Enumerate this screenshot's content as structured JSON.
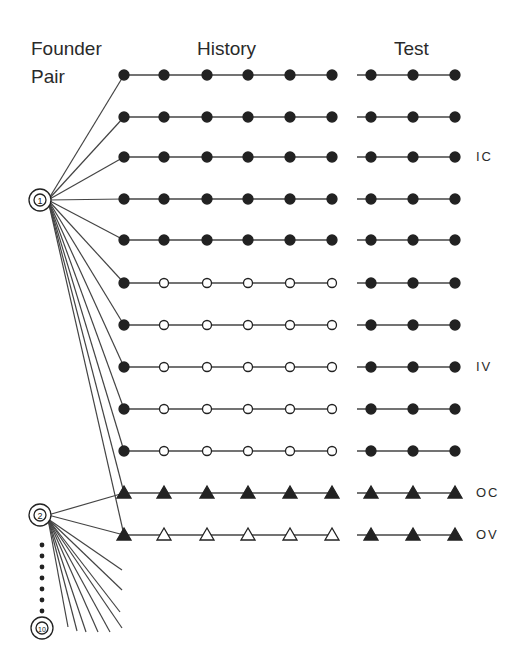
{
  "headers": {
    "founder_line1": "Founder",
    "founder_line2": "Pair",
    "history": "History",
    "test": "Test"
  },
  "founders": [
    {
      "id": "1",
      "x": 40,
      "y": 200
    },
    {
      "id": "2",
      "x": 40,
      "y": 515
    },
    {
      "id": "10",
      "x": 42,
      "y": 628
    }
  ],
  "history_x": [
    124,
    164,
    207,
    248,
    290,
    332
  ],
  "test_x": [
    371,
    413,
    455
  ],
  "test_line_start": 357,
  "rows": [
    {
      "y": 75,
      "founder": 0,
      "shape": "circle",
      "history": [
        "f",
        "f",
        "f",
        "f",
        "f",
        "f"
      ],
      "test": [
        "f",
        "f",
        "f"
      ],
      "label": ""
    },
    {
      "y": 117,
      "founder": 0,
      "shape": "circle",
      "history": [
        "f",
        "f",
        "f",
        "f",
        "f",
        "f"
      ],
      "test": [
        "f",
        "f",
        "f"
      ],
      "label": ""
    },
    {
      "y": 157,
      "founder": 0,
      "shape": "circle",
      "history": [
        "f",
        "f",
        "f",
        "f",
        "f",
        "f"
      ],
      "test": [
        "f",
        "f",
        "f"
      ],
      "label": "IC"
    },
    {
      "y": 199,
      "founder": 0,
      "shape": "circle",
      "history": [
        "f",
        "f",
        "f",
        "f",
        "f",
        "f"
      ],
      "test": [
        "f",
        "f",
        "f"
      ],
      "label": ""
    },
    {
      "y": 240,
      "founder": 0,
      "shape": "circle",
      "history": [
        "f",
        "f",
        "f",
        "f",
        "f",
        "f"
      ],
      "test": [
        "f",
        "f",
        "f"
      ],
      "label": ""
    },
    {
      "y": 283,
      "founder": 0,
      "shape": "circle",
      "history": [
        "f",
        "o",
        "o",
        "o",
        "o",
        "o"
      ],
      "test": [
        "f",
        "f",
        "f"
      ],
      "label": ""
    },
    {
      "y": 325,
      "founder": 0,
      "shape": "circle",
      "history": [
        "f",
        "o",
        "o",
        "o",
        "o",
        "o"
      ],
      "test": [
        "f",
        "f",
        "f"
      ],
      "label": ""
    },
    {
      "y": 367,
      "founder": 0,
      "shape": "circle",
      "history": [
        "f",
        "o",
        "o",
        "o",
        "o",
        "o"
      ],
      "test": [
        "f",
        "f",
        "f"
      ],
      "label": "IV"
    },
    {
      "y": 409,
      "founder": 0,
      "shape": "circle",
      "history": [
        "f",
        "o",
        "o",
        "o",
        "o",
        "o"
      ],
      "test": [
        "f",
        "f",
        "f"
      ],
      "label": ""
    },
    {
      "y": 451,
      "founder": 0,
      "shape": "circle",
      "history": [
        "f",
        "o",
        "o",
        "o",
        "o",
        "o"
      ],
      "test": [
        "f",
        "f",
        "f"
      ],
      "label": ""
    },
    {
      "y": 493,
      "founder": 0,
      "shape": "triangle",
      "history": [
        "f",
        "f",
        "f",
        "f",
        "f",
        "f"
      ],
      "test": [
        "f",
        "f",
        "f"
      ],
      "label": "OC"
    },
    {
      "y": 535,
      "founder": 0,
      "shape": "triangle",
      "history": [
        "f",
        "o",
        "o",
        "o",
        "o",
        "o"
      ],
      "test": [
        "f",
        "f",
        "f"
      ],
      "label": "OV"
    }
  ],
  "founder2_links": [
    493,
    535
  ],
  "fan_ends": [
    [
      122,
      570
    ],
    [
      122,
      590
    ],
    [
      120,
      612
    ],
    [
      122,
      628
    ],
    [
      110,
      632
    ],
    [
      98,
      632
    ],
    [
      86,
      632
    ],
    [
      77,
      631
    ],
    [
      68,
      627
    ]
  ],
  "ellipsis_dots_y": [
    545,
    556,
    567,
    578,
    589,
    600,
    611
  ],
  "colors": {
    "ink": "#222222",
    "line": "#444444",
    "bg": "#ffffff"
  }
}
